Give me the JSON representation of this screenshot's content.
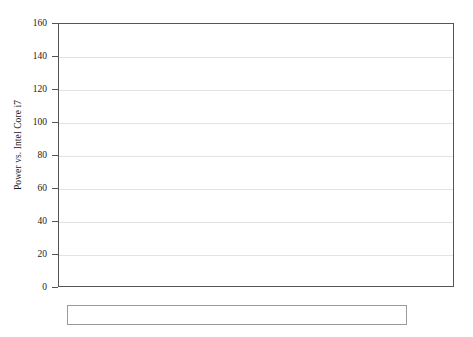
{
  "chart_data": {
    "type": "bar",
    "title": "",
    "xlabel": "",
    "ylabel": "Power vs. Intel Core i7",
    "ylim": [
      0,
      160
    ],
    "yticks": [
      0,
      20,
      40,
      60,
      80,
      100,
      120,
      140,
      160
    ],
    "grid": true,
    "legend_position": "bottom",
    "categories": [
      "Rocchio",
      "KNN",
      "Bayesian"
    ],
    "series": [
      {
        "name": "Jaccard",
        "pattern": "plain",
        "values": [
          93,
          121.5,
          null
        ]
      },
      {
        "name": "Cosine",
        "pattern": "dots",
        "values": [
          114,
          134,
          null
        ]
      },
      {
        "name": "Euclidean",
        "pattern": "diagonal",
        "values": [
          109,
          129,
          null
        ]
      },
      {
        "name": "Pearson",
        "pattern": "horizontal",
        "values": [
          117,
          147,
          null
        ]
      },
      {
        "name": "Manhattan",
        "pattern": "checker",
        "values": [
          86.5,
          92.5,
          null
        ]
      },
      {
        "name": "Bayesian",
        "pattern": "light-gray",
        "values": [
          null,
          null,
          91
        ]
      }
    ]
  },
  "axis": {
    "tick_labels": [
      "160",
      "140",
      "120",
      "100",
      "80",
      "60",
      "40",
      "20",
      "0"
    ],
    "y_title": "Power vs. Intel Core i7"
  },
  "categories": [
    {
      "label": "Rocchio"
    },
    {
      "label": "KNN"
    },
    {
      "label": "Bayesian"
    }
  ],
  "legend": {
    "items": [
      {
        "label": "Jaccard"
      },
      {
        "label": "Cosine"
      },
      {
        "label": "Euclidean"
      },
      {
        "label": "Pearson"
      },
      {
        "label": "Manhattan"
      },
      {
        "label": "Bayesian"
      }
    ]
  },
  "colors": {
    "axis": "#555555",
    "grid": "#e3e3e3",
    "bar_outline": "#555555",
    "text": "#1a1a1a"
  }
}
